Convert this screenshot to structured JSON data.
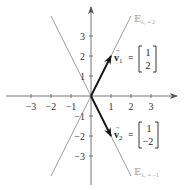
{
  "diagram": {
    "type": "eigenvector-plot",
    "axes": {
      "x_ticks": [
        "−3",
        "−2",
        "−1",
        "1",
        "2",
        "3"
      ],
      "y_ticks": [
        "3",
        "2",
        "1",
        "−1",
        "−2",
        "−3"
      ],
      "range": {
        "x": [
          -4,
          4
        ],
        "y": [
          -4,
          4
        ]
      }
    },
    "eigenlines": [
      {
        "name": "E_lambda1",
        "symbol": "𝔼",
        "subscript": "λ₁ = 2",
        "direction": [
          1,
          2
        ],
        "color": "#9a9a9a"
      },
      {
        "name": "E_lambda2",
        "symbol": "𝔼",
        "subscript": "λ₂ = −1",
        "direction": [
          1,
          -2
        ],
        "color": "#9a9a9a"
      }
    ],
    "vectors": [
      {
        "name": "v1",
        "label": "v⃗₁ =",
        "label_main": "v",
        "label_sub": "1",
        "components": [
          "1",
          "2"
        ],
        "color": "#111111"
      },
      {
        "name": "v2",
        "label": "v⃗₂ =",
        "label_main": "v",
        "label_sub": "2",
        "components": [
          "1",
          "−2"
        ],
        "color": "#111111"
      }
    ],
    "colors": {
      "axis": "#555555",
      "eigenline": "#9a9a9a",
      "vector": "#111111"
    }
  }
}
